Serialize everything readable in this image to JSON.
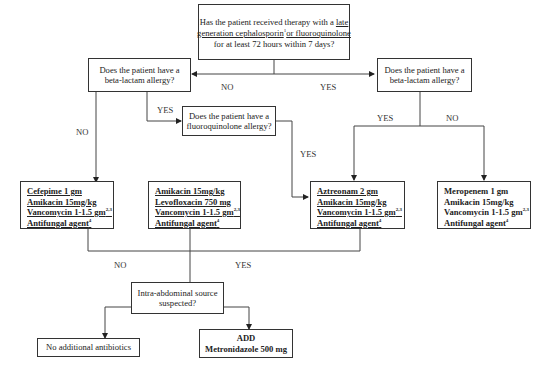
{
  "diagram": {
    "type": "flowchart",
    "nodes": {
      "start": {
        "line1_pre": "Has the patient received therapy with a ",
        "line1_link": "late",
        "line2_link": "generation cephalosporin",
        "line2_sup": "1",
        "line2_link2": "or fluoroquinolone",
        "line3": "for at least 72 hours within 7 days?"
      },
      "beta_left": {
        "line1": "Does the patient have a",
        "line2": "beta-lactam allergy?"
      },
      "beta_right": {
        "line1": "Does the patient have a",
        "line2": "beta-lactam allergy?"
      },
      "fluoro": {
        "line1": "Does the patient have a",
        "line2": "fluoroquinolone allergy?"
      },
      "regimen_cefepime": {
        "items": [
          {
            "text": "Cefepime 1 gm",
            "sup": ""
          },
          {
            "text": "Amikacin 15mg/kg",
            "sup": ""
          },
          {
            "text": "Vancomycin 1-1.5 gm",
            "sup": "2,3"
          },
          {
            "text": "Antifungal agent",
            "sup": "4"
          }
        ]
      },
      "regimen_levofloxacin": {
        "items": [
          {
            "text": "Amikacin 15mg/kg",
            "sup": ""
          },
          {
            "text": "Levofloxacin 750 mg",
            "sup": ""
          },
          {
            "text": "Vancomycin  1-1.5 gm",
            "sup": "2,3"
          },
          {
            "text": "Antifungal agent",
            "sup": "4"
          }
        ]
      },
      "regimen_aztreonam": {
        "items": [
          {
            "text": "Aztreonam 2 gm",
            "sup": ""
          },
          {
            "text": "Amikacin 15mg/kg",
            "sup": ""
          },
          {
            "text": "Vancomycin 1-1.5 gm",
            "sup": "2,3"
          },
          {
            "text": "Antifungal agent",
            "sup": "4"
          }
        ]
      },
      "regimen_meropenem": {
        "items": [
          {
            "text": "Meropenem 1 gm",
            "sup": ""
          },
          {
            "text": "Amikacin 15mg/kg",
            "sup": ""
          },
          {
            "text": "Vancomycin  1-1.5 gm",
            "sup": "2,3"
          },
          {
            "text": "Antifungal agent",
            "sup": "4"
          }
        ]
      },
      "intra_abdominal": {
        "line1": "Intra-abdominal source",
        "line2": "suspected?"
      },
      "no_additional": {
        "text": "No additional antibiotics"
      },
      "add_metronidazole": {
        "line1": "ADD",
        "line2": "Metronidazole 500 mg"
      }
    },
    "edge_labels": {
      "start_no": "NO",
      "start_yes": "YES",
      "beta_left_no": "NO",
      "beta_left_yes": "YES",
      "fluoro_yes": "YES",
      "beta_right_yes": "YES",
      "beta_right_no": "NO",
      "intra_no": "NO",
      "intra_yes": "YES"
    },
    "colors": {
      "line": "#333333",
      "text": "#222222",
      "background": "#ffffff"
    }
  }
}
